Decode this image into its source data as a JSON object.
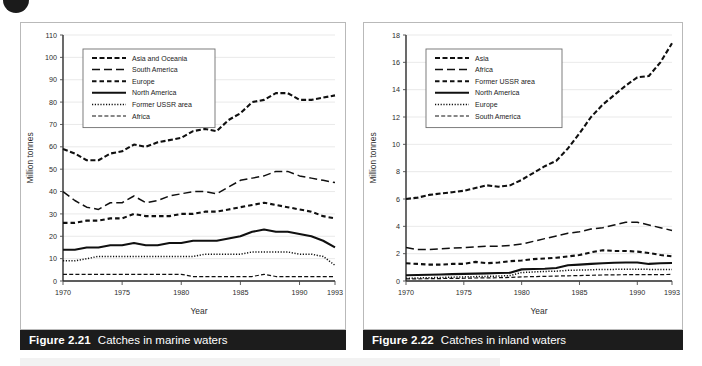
{
  "page": {
    "bullet_icon": "filled-circle-bullet"
  },
  "figures": [
    {
      "id": "fig-2-21",
      "caption_number": "Figure 2.21",
      "caption_text": "Catches in marine waters",
      "chart_data": {
        "type": "line",
        "title": "Catches in marine waters",
        "xlabel": "Year",
        "ylabel": "Million tonnes",
        "grid": true,
        "legend_position": "top-left",
        "xlim": [
          1970,
          1993
        ],
        "ylim": [
          0,
          110
        ],
        "yticks": [
          0,
          10,
          20,
          30,
          40,
          50,
          60,
          70,
          80,
          90,
          100,
          110
        ],
        "xticks": [
          1970,
          1975,
          1980,
          1985,
          1990,
          1993
        ],
        "x": [
          1970,
          1971,
          1972,
          1973,
          1974,
          1975,
          1976,
          1977,
          1978,
          1979,
          1980,
          1981,
          1982,
          1983,
          1984,
          1985,
          1986,
          1987,
          1988,
          1989,
          1990,
          1991,
          1992,
          1993
        ],
        "series": [
          {
            "name": "Asia and Oceania",
            "style": "dash-medium",
            "dasharray": "5,2.5",
            "width": 2.1,
            "values": [
              59,
              57,
              54,
              54,
              57,
              58,
              61,
              60,
              62,
              63,
              64,
              67,
              68,
              67,
              72,
              75,
              80,
              81,
              84,
              84,
              81,
              81,
              82,
              83
            ]
          },
          {
            "name": "South America",
            "style": "dash-long",
            "dasharray": "8,4",
            "width": 1.5,
            "values": [
              40,
              36,
              33,
              32,
              35,
              35,
              38,
              35,
              36,
              38,
              39,
              40,
              40,
              39,
              42,
              45,
              46,
              47,
              49,
              49,
              47,
              46,
              45,
              44
            ]
          },
          {
            "name": "Europe",
            "style": "dash-short",
            "dasharray": "4.5,3",
            "width": 2.1,
            "values": [
              26,
              26,
              27,
              27,
              28,
              28,
              30,
              29,
              29,
              29,
              30,
              30,
              31,
              31,
              32,
              33,
              34,
              35,
              34,
              33,
              32,
              31,
              29,
              28
            ]
          },
          {
            "name": "North America",
            "style": "solid",
            "dasharray": "",
            "width": 2.1,
            "values": [
              14,
              14,
              15,
              15,
              16,
              16,
              17,
              16,
              16,
              17,
              17,
              18,
              18,
              18,
              19,
              20,
              22,
              23,
              22,
              22,
              21,
              20,
              18,
              15
            ]
          },
          {
            "name": "Former USSR area",
            "style": "dotted",
            "dasharray": "1.2,1.6",
            "width": 1.5,
            "values": [
              9,
              9,
              10,
              11,
              11,
              11,
              11,
              11,
              11,
              11,
              11,
              11,
              12,
              12,
              12,
              12,
              13,
              13,
              13,
              13,
              12,
              12,
              11,
              7
            ]
          },
          {
            "name": "Africa",
            "style": "dash-fine",
            "dasharray": "4,2.2",
            "width": 1.2,
            "values": [
              3,
              3,
              3,
              3,
              3,
              3,
              3,
              3,
              3,
              3,
              3,
              2,
              2,
              2,
              2,
              2,
              2,
              3,
              2,
              2,
              2,
              2,
              2,
              2
            ]
          }
        ]
      }
    },
    {
      "id": "fig-2-22",
      "caption_number": "Figure 2.22",
      "caption_text": "Catches in inland waters",
      "chart_data": {
        "type": "line",
        "title": "Catches in inland waters",
        "xlabel": "Year",
        "ylabel": "Million tonnes",
        "grid": true,
        "legend_position": "top-left",
        "xlim": [
          1970,
          1993
        ],
        "ylim": [
          0,
          18
        ],
        "yticks": [
          0,
          2,
          4,
          6,
          8,
          10,
          12,
          14,
          16,
          18
        ],
        "xticks": [
          1970,
          1975,
          1980,
          1985,
          1990,
          1993
        ],
        "x": [
          1970,
          1971,
          1972,
          1973,
          1974,
          1975,
          1976,
          1977,
          1978,
          1979,
          1980,
          1981,
          1982,
          1983,
          1984,
          1985,
          1986,
          1987,
          1988,
          1989,
          1990,
          1991,
          1992,
          1993
        ],
        "series": [
          {
            "name": "Asia",
            "style": "dash-medium",
            "dasharray": "5,2.5",
            "width": 2.1,
            "values": [
              6.0,
              6.1,
              6.3,
              6.4,
              6.5,
              6.6,
              6.8,
              7.0,
              6.9,
              7.0,
              7.4,
              7.9,
              8.4,
              8.8,
              9.7,
              10.8,
              12.0,
              12.9,
              13.6,
              14.3,
              14.9,
              15.0,
              16.0,
              17.4
            ]
          },
          {
            "name": "Africa",
            "style": "dash-long",
            "dasharray": "8,4",
            "width": 1.5,
            "values": [
              2.45,
              2.3,
              2.3,
              2.35,
              2.4,
              2.45,
              2.5,
              2.55,
              2.55,
              2.6,
              2.7,
              2.9,
              3.1,
              3.3,
              3.5,
              3.6,
              3.8,
              3.9,
              4.1,
              4.3,
              4.3,
              4.1,
              3.9,
              3.7
            ]
          },
          {
            "name": "Former USSR area",
            "style": "dash-short",
            "dasharray": "4.5,3",
            "width": 2.1,
            "values": [
              1.3,
              1.25,
              1.2,
              1.2,
              1.25,
              1.25,
              1.4,
              1.3,
              1.35,
              1.45,
              1.5,
              1.6,
              1.65,
              1.7,
              1.8,
              1.9,
              2.1,
              2.25,
              2.2,
              2.2,
              2.15,
              2.05,
              1.9,
              1.8
            ]
          },
          {
            "name": "North America",
            "style": "solid",
            "dasharray": "",
            "width": 2.1,
            "values": [
              0.42,
              0.44,
              0.46,
              0.48,
              0.5,
              0.52,
              0.54,
              0.56,
              0.58,
              0.6,
              0.85,
              0.88,
              0.9,
              0.95,
              1.15,
              1.2,
              1.25,
              1.3,
              1.33,
              1.35,
              1.35,
              1.25,
              1.3,
              1.32
            ]
          },
          {
            "name": "Europe",
            "style": "dotted",
            "dasharray": "1.2,1.6",
            "width": 1.5,
            "values": [
              0.2,
              0.22,
              0.24,
              0.26,
              0.28,
              0.3,
              0.32,
              0.34,
              0.36,
              0.4,
              0.62,
              0.66,
              0.7,
              0.72,
              0.78,
              0.8,
              0.82,
              0.85,
              0.85,
              0.86,
              0.86,
              0.85,
              0.85,
              0.85
            ]
          },
          {
            "name": "South America",
            "style": "dash-fine",
            "dasharray": "4,2.2",
            "width": 1.2,
            "values": [
              0.15,
              0.16,
              0.17,
              0.18,
              0.19,
              0.2,
              0.22,
              0.23,
              0.24,
              0.26,
              0.3,
              0.32,
              0.34,
              0.36,
              0.38,
              0.4,
              0.42,
              0.44,
              0.45,
              0.46,
              0.47,
              0.46,
              0.47,
              0.48
            ]
          }
        ]
      }
    }
  ]
}
